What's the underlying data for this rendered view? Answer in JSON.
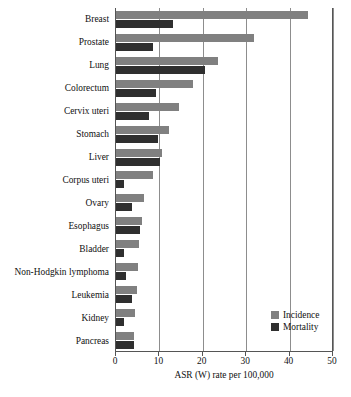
{
  "chart_data": {
    "type": "bar",
    "orientation": "horizontal",
    "title": "",
    "xlabel": "ASR (W) rate per 100,000",
    "ylabel": "",
    "xlim": [
      0,
      50
    ],
    "xticks": [
      0,
      10,
      20,
      30,
      40,
      50
    ],
    "grid": true,
    "legend_position": "bottom-right",
    "categories": [
      "Breast",
      "Prostate",
      "Lung",
      "Colorectum",
      "Cervix uteri",
      "Stomach",
      "Liver",
      "Corpus uteri",
      "Ovary",
      "Esophagus",
      "Bladder",
      "Non-Hodgkin lymphoma",
      "Leukemia",
      "Kidney",
      "Pancreas"
    ],
    "series": [
      {
        "name": "Incidence",
        "color": "#808080",
        "values": [
          44.2,
          31.8,
          23.4,
          17.8,
          14.5,
          12.2,
          10.5,
          8.6,
          6.5,
          5.9,
          5.4,
          5.1,
          4.8,
          4.4,
          4.2
        ]
      },
      {
        "name": "Mortality",
        "color": "#2f2f2f",
        "values": [
          13.2,
          8.5,
          20.4,
          9.2,
          7.5,
          9.7,
          10.1,
          1.8,
          3.7,
          5.6,
          1.9,
          2.4,
          3.6,
          1.8,
          4.1
        ]
      }
    ]
  },
  "legend": {
    "items": [
      {
        "label": "Incidence",
        "swatch": "incidence-swatch"
      },
      {
        "label": "Mortality",
        "swatch": "mortality-swatch"
      }
    ]
  },
  "axis": {
    "x_title": "ASR (W) rate per 100,000",
    "tick_labels": [
      "0",
      "10",
      "20",
      "30",
      "40",
      "50"
    ]
  },
  "colors": {
    "incidence": "#808080",
    "mortality": "#2f2f2f",
    "gridline": "#8d8d8d",
    "frame": "#555555"
  }
}
